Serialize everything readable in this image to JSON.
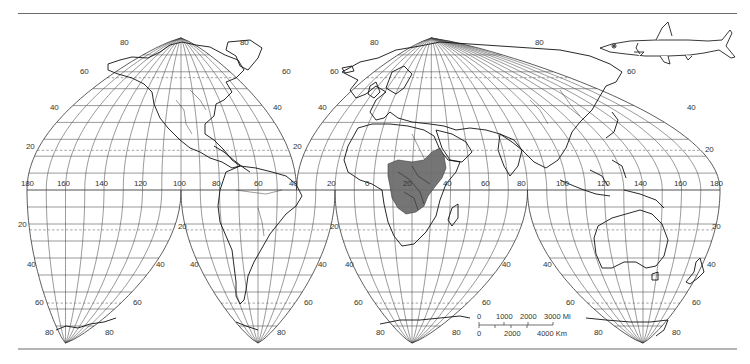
{
  "map": {
    "projection": "Goode homolosine (interrupted)",
    "colors": {
      "graticule": "#555555",
      "coast": "#111111",
      "range_fill": "#6e6e6e",
      "frame": "#6a6a6a",
      "background": "#ffffff"
    },
    "equator_longitude_labels": [
      {
        "text": "180",
        "x": 27
      },
      {
        "text": "160",
        "x": 63
      },
      {
        "text": "140",
        "x": 101
      },
      {
        "text": "120",
        "x": 140
      },
      {
        "text": "100",
        "x": 179
      },
      {
        "text": "80",
        "x": 218
      },
      {
        "text": "60",
        "x": 260
      },
      {
        "text": "40",
        "x": 295
      },
      {
        "text": "20",
        "x": 333
      },
      {
        "text": "0",
        "x": 371
      },
      {
        "text": "20",
        "x": 409
      },
      {
        "text": "40",
        "x": 449
      },
      {
        "text": "60",
        "x": 487
      },
      {
        "text": "80",
        "x": 523
      },
      {
        "text": "100",
        "x": 562
      },
      {
        "text": "120",
        "x": 603
      },
      {
        "text": "140",
        "x": 640
      },
      {
        "text": "160",
        "x": 680
      },
      {
        "text": "180",
        "x": 716
      }
    ],
    "latitude_labels": [
      {
        "text": "80",
        "x": 120,
        "y": 43
      },
      {
        "text": "80",
        "x": 240,
        "y": 43
      },
      {
        "text": "60",
        "x": 80,
        "y": 72
      },
      {
        "text": "60",
        "x": 282,
        "y": 72
      },
      {
        "text": "40",
        "x": 50,
        "y": 108
      },
      {
        "text": "40",
        "x": 273,
        "y": 108
      },
      {
        "text": "20",
        "x": 26,
        "y": 147
      },
      {
        "text": "20",
        "x": 293,
        "y": 147
      },
      {
        "text": "80",
        "x": 370,
        "y": 43
      },
      {
        "text": "80",
        "x": 535,
        "y": 43
      },
      {
        "text": "60",
        "x": 330,
        "y": 72
      },
      {
        "text": "60",
        "x": 627,
        "y": 72
      },
      {
        "text": "40",
        "x": 318,
        "y": 108
      },
      {
        "text": "40",
        "x": 687,
        "y": 108
      },
      {
        "text": "20",
        "x": 705,
        "y": 150
      },
      {
        "text": "20",
        "x": 18,
        "y": 225
      },
      {
        "text": "20",
        "x": 178,
        "y": 227
      },
      {
        "text": "40",
        "x": 27,
        "y": 265
      },
      {
        "text": "40",
        "x": 156,
        "y": 265
      },
      {
        "text": "60",
        "x": 35,
        "y": 303
      },
      {
        "text": "60",
        "x": 133,
        "y": 303
      },
      {
        "text": "80",
        "x": 45,
        "y": 333
      },
      {
        "text": "80",
        "x": 105,
        "y": 333
      },
      {
        "text": "40",
        "x": 190,
        "y": 265
      },
      {
        "text": "20",
        "x": 330,
        "y": 227
      },
      {
        "text": "40",
        "x": 318,
        "y": 265
      },
      {
        "text": "60",
        "x": 304,
        "y": 303
      },
      {
        "text": "80",
        "x": 277,
        "y": 333
      },
      {
        "text": "40",
        "x": 345,
        "y": 265
      },
      {
        "text": "60",
        "x": 354,
        "y": 303
      },
      {
        "text": "80",
        "x": 376,
        "y": 333
      },
      {
        "text": "80",
        "x": 452,
        "y": 333
      },
      {
        "text": "60",
        "x": 482,
        "y": 303
      },
      {
        "text": "40",
        "x": 502,
        "y": 265
      },
      {
        "text": "40",
        "x": 543,
        "y": 265
      },
      {
        "text": "60",
        "x": 566,
        "y": 303
      },
      {
        "text": "80",
        "x": 594,
        "y": 333
      },
      {
        "text": "80",
        "x": 672,
        "y": 333
      },
      {
        "text": "60",
        "x": 692,
        "y": 303
      },
      {
        "text": "40",
        "x": 707,
        "y": 265
      },
      {
        "text": "20",
        "x": 712,
        "y": 227
      }
    ],
    "legend_icon": "fish-illustration",
    "range_region": "Central Africa (shaded distribution area)"
  },
  "scale_bar": {
    "miles_labels": [
      "0",
      "1000",
      "2000",
      "3000 Mi"
    ],
    "km_labels": [
      "0",
      "2000",
      "4000 Km"
    ]
  }
}
